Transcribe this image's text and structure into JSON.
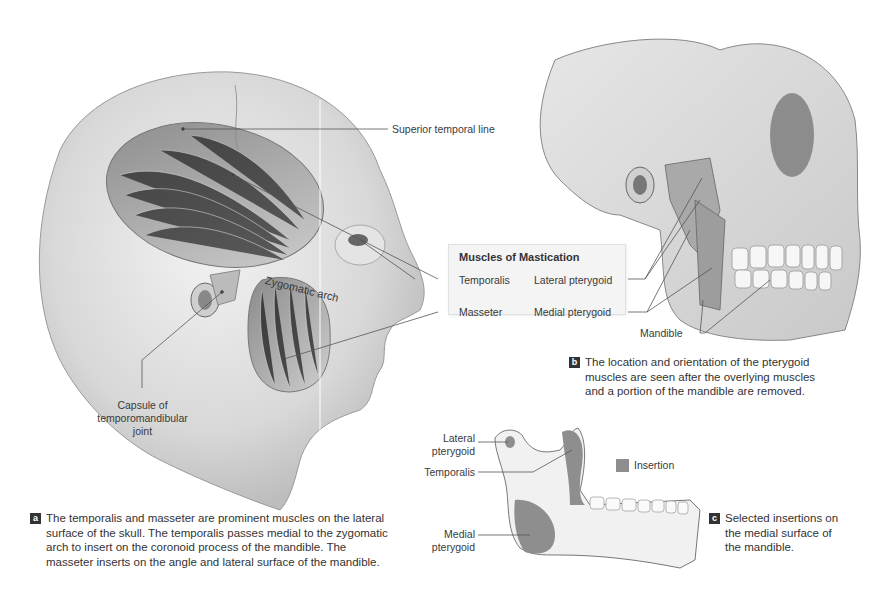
{
  "figure": {
    "panel_a": {
      "badge": "a",
      "labels": {
        "superior_temporal_line": "Superior temporal line",
        "zygomatic_arch": "Zygomatic arch",
        "capsule": [
          "Capsule of",
          "temporomandibular",
          "joint"
        ]
      },
      "caption": [
        "The temporalis and masseter are prominent muscles on the lateral",
        "surface of the skull. The temporalis passes medial to the zygomatic",
        "arch to insert on the coronoid process of the mandible. The",
        "masseter inserts on the angle and lateral surface of the mandible."
      ]
    },
    "legend": {
      "title": "Muscles of Mastication",
      "items": [
        "Temporalis",
        "Lateral pterygoid",
        "Masseter",
        "Medial pterygoid"
      ]
    },
    "panel_b": {
      "badge": "b",
      "labels": {
        "mandible": "Mandible"
      },
      "caption": [
        "The location and orientation of the pterygoid",
        "muscles are seen after the overlying muscles",
        "and a portion of the mandible are removed."
      ]
    },
    "panel_c": {
      "badge": "c",
      "labels": {
        "lateral_pterygoid": [
          "Lateral",
          "pterygoid"
        ],
        "temporalis": "Temporalis",
        "medial_pterygoid": [
          "Medial",
          "pterygoid"
        ],
        "insertion": "Insertion"
      },
      "insertion_color": "#8e8e8e",
      "caption": [
        "Selected insertions on",
        "the medial surface of",
        "the mandible."
      ]
    }
  }
}
